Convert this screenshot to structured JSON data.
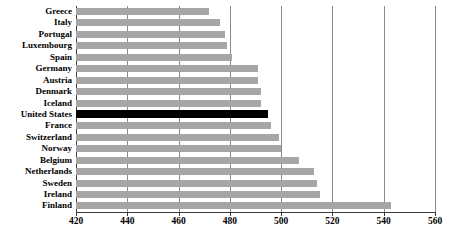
{
  "chart_data": {
    "type": "bar",
    "orientation": "horizontal",
    "title": "",
    "subtitle": "",
    "xlabel": "",
    "ylabel": "",
    "xlim": [
      420,
      560
    ],
    "xticks": [
      420,
      440,
      460,
      480,
      500,
      520,
      540,
      560
    ],
    "xtick_labels": [
      "420",
      "440",
      "460",
      "480",
      "500",
      "520",
      "540",
      "560"
    ],
    "grid": true,
    "grid_axis": "x",
    "legend": null,
    "categories": [
      "Greece",
      "Italy",
      "Portugal",
      "Luxembourg",
      "Spain",
      "Germany",
      "Austria",
      "Denmark",
      "Iceland",
      "United States",
      "France",
      "Switzerland",
      "Norway",
      "Belgium",
      "Netherlands",
      "Sweden",
      "Ireland",
      "Finland"
    ],
    "values": [
      472,
      476,
      478,
      479,
      481,
      491,
      491,
      492,
      492,
      495,
      496,
      499,
      500,
      507,
      513,
      514,
      515,
      543
    ],
    "highlighted_category": "United States",
    "colors": {
      "bar": "#a6a6a6",
      "bar_highlight": "#000000",
      "gridline": "#8a8a8a",
      "axis": "#3a3a3a",
      "background": "#ffffff",
      "text": "#000000"
    }
  }
}
